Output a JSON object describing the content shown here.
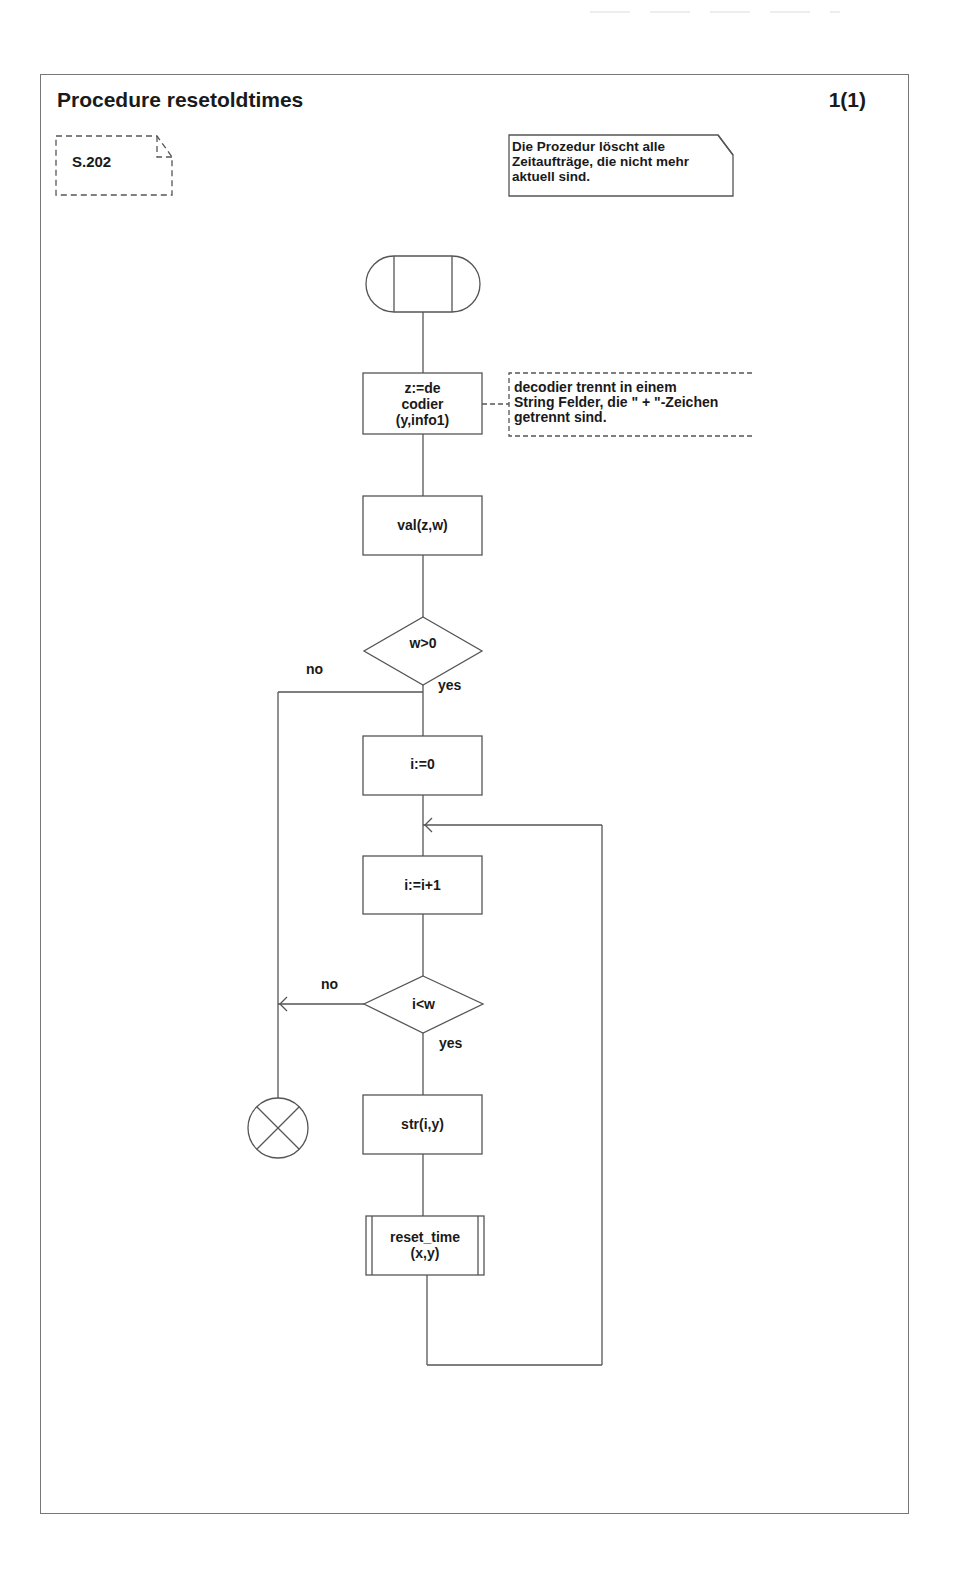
{
  "page": {
    "title": "Procedure resetoldtimes",
    "page_number": "1(1)"
  },
  "reference_note": {
    "label": "S.202"
  },
  "description_note": {
    "lines": [
      "Die Prozedur löscht alle",
      "Zeitaufträge, die nicht mehr",
      "aktuell sind."
    ]
  },
  "flowchart": {
    "start": {
      "type": "procedure-start",
      "icon": "procedure-start-symbol"
    },
    "nodes": [
      {
        "id": "decode",
        "type": "task",
        "lines": [
          "z:=de",
          "codier",
          "(y,info1)"
        ]
      },
      {
        "id": "val",
        "type": "task",
        "lines": [
          "val(z,w)"
        ]
      },
      {
        "id": "check_w",
        "type": "decision",
        "lines": [
          "w>0"
        ]
      },
      {
        "id": "init_i",
        "type": "task",
        "lines": [
          "i:=0"
        ]
      },
      {
        "id": "inc_i",
        "type": "task",
        "lines": [
          "i:=i+1"
        ]
      },
      {
        "id": "check_i",
        "type": "decision",
        "lines": [
          "i<w"
        ]
      },
      {
        "id": "str",
        "type": "task",
        "lines": [
          "str(i,y)"
        ]
      },
      {
        "id": "reset_time",
        "type": "procedure-call",
        "lines": [
          "reset_time",
          "(x,y)"
        ]
      }
    ],
    "end": {
      "type": "stop",
      "icon": "stop-symbol"
    },
    "comment": {
      "attached_to": "decode",
      "lines": [
        "decodier trennt in einem",
        "String Felder, die \" + \"-Zeichen",
        "getrennt sind."
      ]
    },
    "branches": {
      "check_w_no": "no",
      "check_w_yes": "yes",
      "check_i_no": "no",
      "check_i_yes": "yes"
    }
  },
  "colors": {
    "line": "#555555",
    "text": "#1a1a1a",
    "background": "#ffffff"
  }
}
